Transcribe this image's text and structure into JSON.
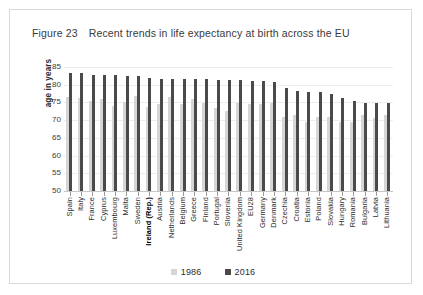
{
  "figure": {
    "number_label": "Figure 23",
    "title": "Recent trends in life expectancy at birth across the EU"
  },
  "axis": {
    "y_title": "age in years",
    "y_ticks": [
      "85",
      "80",
      "75",
      "70",
      "65",
      "60",
      "55",
      "50"
    ]
  },
  "legend": {
    "items": [
      {
        "label": "1986",
        "color": "#d6d6d6"
      },
      {
        "label": "2016",
        "color": "#4a4a4a"
      }
    ]
  },
  "chart_data": {
    "type": "bar",
    "title": "Recent trends in life expectancy at birth across the EU",
    "xlabel": "",
    "ylabel": "age in years",
    "ylim": [
      50,
      85
    ],
    "y_tick_step": 5,
    "grid": true,
    "legend_position": "bottom-center",
    "categories": [
      "Spain",
      "Italy",
      "France",
      "Cyprus",
      "Luxembourg",
      "Malta",
      "Sweden",
      "Ireland (Rep.)",
      "Austria",
      "Netherlands",
      "Belgium",
      "Greece",
      "Finland",
      "Portugal",
      "Slovenia",
      "United Kingdom",
      "EU28",
      "Germany",
      "Denmark",
      "Czechia",
      "Croatia",
      "Estonia",
      "Poland",
      "Slovakia",
      "Hungary",
      "Romania",
      "Bulgaria",
      "Latvia",
      "Lithuania"
    ],
    "highlight_category": "Ireland (Rep.)",
    "series": [
      {
        "name": "1986",
        "color": "#d6d6d6",
        "values": [
          76.5,
          76.2,
          75.5,
          76.0,
          74.0,
          75.0,
          76.8,
          73.8,
          74.5,
          76.5,
          74.5,
          76.0,
          74.8,
          73.5,
          72.5,
          74.8,
          74.5,
          74.5,
          74.8,
          71.0,
          71.5,
          69.5,
          70.8,
          71.0,
          69.5,
          69.5,
          71.5,
          70.5,
          71.5
        ]
      },
      {
        "name": "2016",
        "color": "#4a4a4a",
        "values": [
          83.4,
          83.4,
          82.7,
          82.7,
          82.7,
          82.6,
          82.4,
          81.8,
          81.7,
          81.6,
          81.5,
          81.5,
          81.5,
          81.3,
          81.2,
          81.2,
          81.0,
          81.0,
          80.9,
          79.1,
          78.2,
          78.0,
          78.0,
          77.3,
          76.2,
          75.3,
          74.9,
          74.9,
          74.9
        ]
      }
    ]
  }
}
